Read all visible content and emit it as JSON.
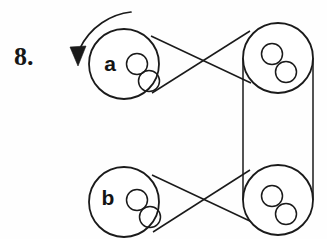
{
  "figure": {
    "problem_number": "8.",
    "background_color": "#fefefe",
    "stroke_color": "#1a1a1a",
    "canvas": {
      "width": 327,
      "height": 239
    }
  },
  "rotation_arrow": {
    "name": "rotation-direction-arrow",
    "description": "curved arrow indicating counter-clockwise rotation of pulley a",
    "path": "M 131 12 C 112 14, 90 26, 79 50",
    "head_points": "70,47 86,46 78,66",
    "stroke_width": 1.7
  },
  "pulleys": [
    {
      "id": "pulley-a",
      "label": "a",
      "label_x": 110,
      "label_y": 71,
      "cx": 124,
      "cy": 64,
      "r": 35,
      "stroke_width": 1.8,
      "holes": [
        {
          "cx": 137,
          "cy": 64,
          "r": 10.5
        },
        {
          "cx": 149,
          "cy": 81,
          "r": 10.5
        }
      ]
    },
    {
      "id": "pulley-top-right",
      "label": "",
      "label_x": 0,
      "label_y": 0,
      "cx": 278,
      "cy": 58,
      "r": 35,
      "stroke_width": 1.8,
      "holes": [
        {
          "cx": 272,
          "cy": 54,
          "r": 10.5
        },
        {
          "cx": 286,
          "cy": 72,
          "r": 10.5
        }
      ]
    },
    {
      "id": "pulley-b",
      "label": "b",
      "label_x": 108,
      "label_y": 205,
      "cx": 124,
      "cy": 202,
      "r": 35,
      "stroke_width": 1.8,
      "holes": [
        {
          "cx": 137,
          "cy": 200,
          "r": 10.5
        },
        {
          "cx": 150,
          "cy": 217,
          "r": 10.5
        }
      ]
    },
    {
      "id": "pulley-bottom-right",
      "label": "",
      "label_x": 0,
      "label_y": 0,
      "cx": 278,
      "cy": 200,
      "r": 35,
      "stroke_width": 1.8,
      "holes": [
        {
          "cx": 272,
          "cy": 196,
          "r": 10.5
        },
        {
          "cx": 286,
          "cy": 214,
          "r": 10.5
        }
      ]
    }
  ],
  "belts": [
    {
      "id": "belt-top-crossed",
      "type": "crossed",
      "connects": [
        "pulley-a",
        "pulley-top-right"
      ],
      "lines": [
        {
          "x1": 151,
          "y1": 36,
          "x2": 251,
          "y2": 83
        },
        {
          "x1": 152,
          "y1": 93,
          "x2": 250,
          "y2": 31
        }
      ],
      "stroke_width": 1.5
    },
    {
      "id": "belt-right-open",
      "type": "open",
      "connects": [
        "pulley-top-right",
        "pulley-bottom-right"
      ],
      "lines": [
        {
          "x1": 243,
          "y1": 58,
          "x2": 243,
          "y2": 200
        },
        {
          "x1": 313,
          "y1": 58,
          "x2": 313,
          "y2": 200
        }
      ],
      "stroke_width": 1.5
    },
    {
      "id": "belt-bottom-crossed",
      "type": "crossed",
      "connects": [
        "pulley-b",
        "pulley-bottom-right"
      ],
      "lines": [
        {
          "x1": 152,
          "y1": 175,
          "x2": 252,
          "y2": 222
        },
        {
          "x1": 153,
          "y1": 232,
          "x2": 250,
          "y2": 170
        }
      ],
      "stroke_width": 1.5
    }
  ]
}
